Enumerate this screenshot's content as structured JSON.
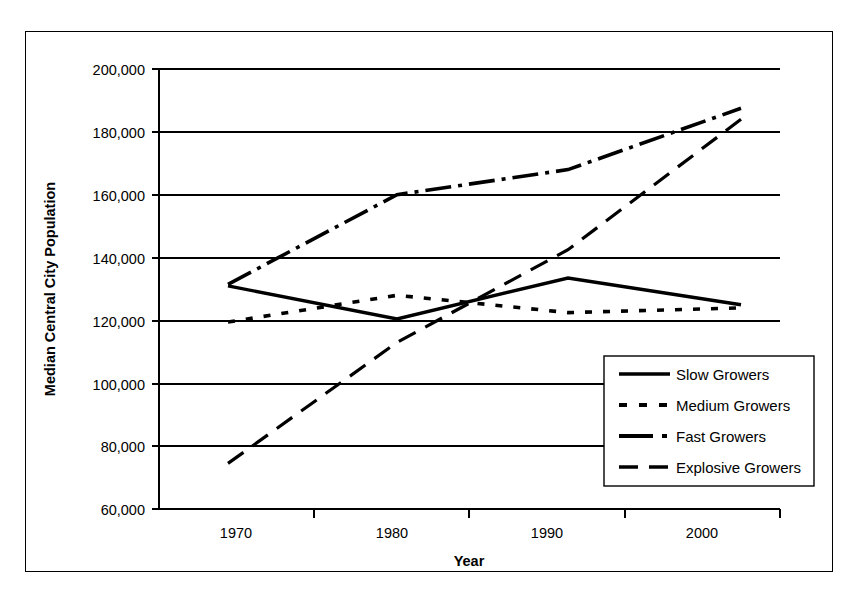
{
  "chart_data": {
    "type": "line",
    "title": "",
    "xlabel": "Year",
    "ylabel": "Median Central City Population",
    "categories": [
      "1970",
      "1980",
      "1990",
      "2000"
    ],
    "x": [
      1970,
      1980,
      1990,
      2000
    ],
    "ylim": [
      60000,
      200000
    ],
    "yticks": [
      60000,
      80000,
      100000,
      120000,
      140000,
      160000,
      180000,
      200000
    ],
    "ytick_labels": [
      "60,000",
      "80,000",
      "100,000",
      "120,000",
      "140,000",
      "160,000",
      "180,000",
      "200,000"
    ],
    "xtick_labels": [
      "1970",
      "1980",
      "1990",
      "2000"
    ],
    "grid": "horizontal",
    "legend_position": "lower-right-inside",
    "series": [
      {
        "name": "Slow Growers",
        "style": "solid",
        "color": "#000000",
        "width": 3.2,
        "values": [
          131000,
          120500,
          133500,
          125000
        ]
      },
      {
        "name": "Medium Growers",
        "style": "dotted",
        "color": "#000000",
        "width": 3.2,
        "values": [
          119500,
          128000,
          122500,
          124000
        ]
      },
      {
        "name": "Fast Growers",
        "style": "dash-dot",
        "color": "#000000",
        "width": 3.2,
        "values": [
          131500,
          160000,
          168000,
          187500
        ]
      },
      {
        "name": "Explosive Growers",
        "style": "long-dash",
        "color": "#000000",
        "width": 3.2,
        "values": [
          74500,
          113000,
          142500,
          184000
        ]
      }
    ]
  },
  "axes": {
    "y_title": "Median Central City Population",
    "x_title": "Year",
    "y_labels": [
      "200,000",
      "180,000",
      "160,000",
      "140,000",
      "120,000",
      "100,000",
      "80,000",
      "60,000"
    ],
    "x_labels": [
      "1970",
      "1980",
      "1990",
      "2000"
    ]
  },
  "legend": {
    "items": [
      {
        "label": "Slow Growers",
        "style": "solid"
      },
      {
        "label": "Medium Growers",
        "style": "dotted"
      },
      {
        "label": "Fast Growers",
        "style": "dash-dot"
      },
      {
        "label": "Explosive Growers",
        "style": "long-dash"
      }
    ]
  }
}
